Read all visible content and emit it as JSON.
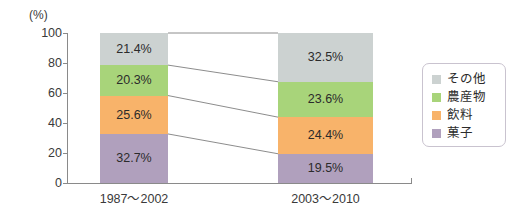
{
  "chart_data": {
    "type": "bar",
    "subtype": "stacked-100-percent",
    "title": "",
    "subtitle": "",
    "xlabel": "",
    "ylabel": "",
    "unit_label": "(%)",
    "categories": [
      "1987〜2002",
      "2003〜2010"
    ],
    "ylim": [
      0,
      100
    ],
    "y_ticks": [
      0,
      20,
      40,
      60,
      80,
      100
    ],
    "y_tick_labels": [
      "0",
      "20",
      "40",
      "60",
      "80",
      "100"
    ],
    "grid": false,
    "legend_position": "right",
    "connectors": true,
    "series": [
      {
        "name": "その他",
        "color": "#ccd2d1",
        "values": [
          21.4,
          32.5
        ],
        "labels": [
          "21.4%",
          "32.5%"
        ]
      },
      {
        "name": "農産物",
        "color": "#a8d47a",
        "values": [
          20.3,
          23.6
        ],
        "labels": [
          "20.3%",
          "23.6%"
        ]
      },
      {
        "name": "飲料",
        "color": "#f8b36a",
        "values": [
          25.6,
          24.4
        ],
        "labels": [
          "25.6%",
          "24.4%"
        ]
      },
      {
        "name": "菓子",
        "color": "#b0a0bd",
        "values": [
          32.7,
          19.5
        ],
        "labels": [
          "32.7%",
          "19.5%"
        ]
      }
    ]
  },
  "legend": {
    "items": [
      {
        "label": "その他",
        "color": "#ccd2d1"
      },
      {
        "label": "農産物",
        "color": "#a8d47a"
      },
      {
        "label": "飲料",
        "color": "#f8b36a"
      },
      {
        "label": "菓子",
        "color": "#b0a0bd"
      }
    ]
  },
  "colors": {
    "axis": "#8a8a8a",
    "text": "#2b2b2b",
    "background": "#ffffff",
    "connector": "#6f6f6f",
    "legend_border": "#c9c3cf"
  }
}
